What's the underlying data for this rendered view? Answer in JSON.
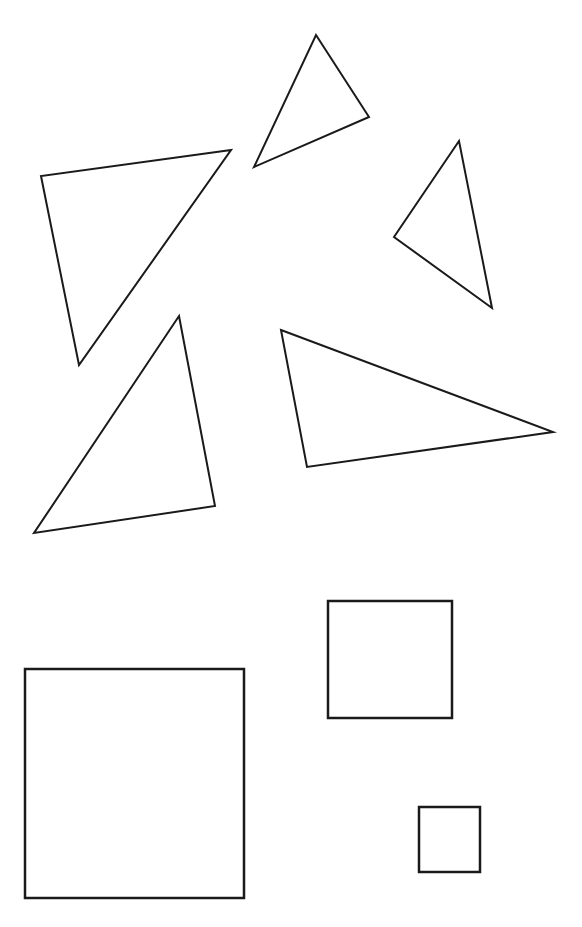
{
  "canvas": {
    "width": 582,
    "height": 927,
    "background_color": "#ffffff",
    "title": "geometric-shapes-figure"
  },
  "style": {
    "stroke_color": "#1a1a1a",
    "fill_color": "#ffffff",
    "triangle_stroke_width": 2,
    "square_stroke_width": 2.5
  },
  "groups": {
    "triangles_label": "triangles",
    "squares_label": "squares"
  },
  "shapes": [
    {
      "id": "triangle-top-center",
      "name": "triangle-top-center",
      "type": "triangle",
      "points": "316,35 369,117 254,167",
      "vertices": [
        [
          316,
          35
        ],
        [
          369,
          117
        ],
        [
          254,
          167
        ]
      ],
      "stroke_width": 2
    },
    {
      "id": "triangle-upper-left-large",
      "name": "triangle-upper-left-large",
      "type": "triangle",
      "points": "231,150 41,176 79,365",
      "vertices": [
        [
          231,
          150
        ],
        [
          41,
          176
        ],
        [
          79,
          365
        ]
      ],
      "stroke_width": 2
    },
    {
      "id": "triangle-right",
      "name": "triangle-right",
      "type": "triangle",
      "points": "459,141 394,237 492,308",
      "vertices": [
        [
          459,
          141
        ],
        [
          394,
          237
        ],
        [
          492,
          308
        ]
      ],
      "stroke_width": 2
    },
    {
      "id": "triangle-lower-left",
      "name": "triangle-lower-left",
      "type": "triangle",
      "points": "179,316 215,506 34,533",
      "vertices": [
        [
          179,
          316
        ],
        [
          215,
          506
        ],
        [
          34,
          533
        ]
      ],
      "stroke_width": 2
    },
    {
      "id": "triangle-lower-right-wide",
      "name": "triangle-lower-right-wide",
      "type": "triangle",
      "points": "281,330 553,432 307,467",
      "vertices": [
        [
          281,
          330
        ],
        [
          553,
          432
        ],
        [
          307,
          467
        ]
      ],
      "stroke_width": 2
    },
    {
      "id": "square-large",
      "name": "square-large",
      "type": "square",
      "x": 25,
      "y": 669,
      "width": 219,
      "height": 229,
      "stroke_width": 2.5
    },
    {
      "id": "square-medium",
      "name": "square-medium",
      "type": "square",
      "x": 328,
      "y": 601,
      "width": 124,
      "height": 117,
      "stroke_width": 2.5
    },
    {
      "id": "square-small",
      "name": "square-small",
      "type": "square",
      "x": 419,
      "y": 807,
      "width": 61,
      "height": 65,
      "stroke_width": 2.5
    }
  ]
}
